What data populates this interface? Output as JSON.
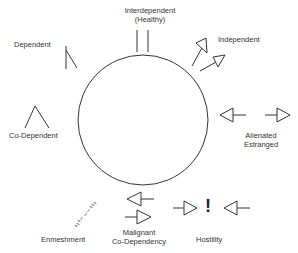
{
  "diagram": {
    "type": "relationship-styles",
    "center_shape": "circle",
    "labels": {
      "interdependent": "Interdependent",
      "healthy": "(Healthy)",
      "independent": "Independent",
      "dependent": "Dependent",
      "codependent": "Co-Dependent",
      "alienated": "Alienated",
      "estranged": "Estranged",
      "enmeshment": "Enmeshment",
      "malignant": "Malignant",
      "malignant_codependency": "Co-Dependency",
      "hostility": "Hostility"
    },
    "enmeshment_scribble": "ꝛꝛꝛ∽∽∽ꝛꝛꝛ",
    "hostility_mark": "!",
    "colors": {
      "stroke": "#333333",
      "text": "#333333",
      "background": "#ffffff"
    }
  }
}
